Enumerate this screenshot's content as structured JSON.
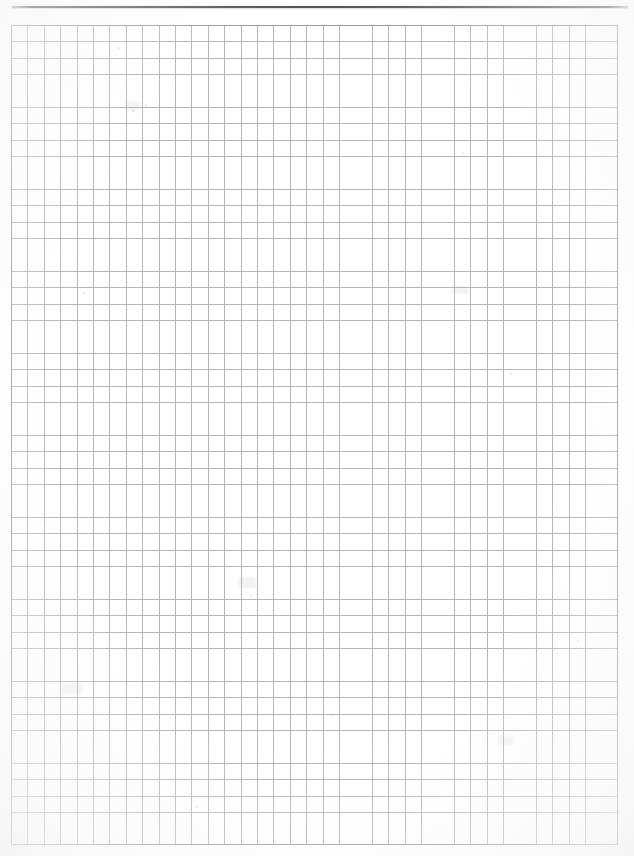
{
  "document": {
    "kind": "scanned-page",
    "page_type": "blank graph paper",
    "background_color": "#ffffff",
    "width_px": 634,
    "height_px": 856
  },
  "header": {
    "rule_present": true,
    "rule_color": "#4e4e54",
    "top_mark_text": "",
    "top_mark_note": "faint cut-off mark at top centre"
  },
  "grid": {
    "line_color": "#a8a8ae",
    "frame_color": "#96969c",
    "cell_size_px": 16.4,
    "columns": 37,
    "rows": 50,
    "left_px": 11,
    "top_px": 25,
    "width_px": 607,
    "height_px": 820,
    "content": ""
  },
  "artifacts": {
    "specks": [
      {
        "x": 118,
        "y": 47,
        "w": 2,
        "h": 2
      },
      {
        "x": 145,
        "y": 104,
        "w": 2,
        "h": 2
      },
      {
        "x": 132,
        "y": 110,
        "w": 3,
        "h": 2
      },
      {
        "x": 259,
        "y": 203,
        "w": 2,
        "h": 2
      },
      {
        "x": 462,
        "y": 152,
        "w": 2,
        "h": 2
      },
      {
        "x": 83,
        "y": 292,
        "w": 2,
        "h": 2
      },
      {
        "x": 250,
        "y": 594,
        "w": 2,
        "h": 3
      },
      {
        "x": 510,
        "y": 373,
        "w": 2,
        "h": 2
      },
      {
        "x": 331,
        "y": 714,
        "w": 2,
        "h": 2
      },
      {
        "x": 196,
        "y": 806,
        "w": 2,
        "h": 2
      },
      {
        "x": 577,
        "y": 640,
        "w": 2,
        "h": 2
      },
      {
        "x": 44,
        "y": 521,
        "w": 2,
        "h": 2
      }
    ],
    "smudges": [
      {
        "x": 126,
        "y": 101,
        "w": 14,
        "h": 9
      },
      {
        "x": 238,
        "y": 577,
        "w": 18,
        "h": 11
      },
      {
        "x": 452,
        "y": 286,
        "w": 16,
        "h": 8
      },
      {
        "x": 62,
        "y": 684,
        "w": 20,
        "h": 10
      },
      {
        "x": 498,
        "y": 736,
        "w": 15,
        "h": 9
      }
    ]
  }
}
